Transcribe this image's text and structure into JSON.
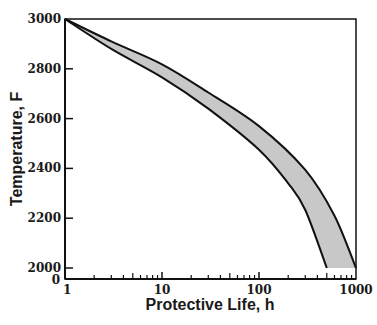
{
  "chart_data": {
    "type": "area",
    "title": "",
    "xlabel": "Protective Life, h",
    "ylabel": "Temperature, F",
    "x_scale": "log",
    "xlim": [
      1,
      1000
    ],
    "ylim": [
      2000,
      3000
    ],
    "y_axis_break_label": "0",
    "x_ticks": [
      1,
      10,
      100,
      1000
    ],
    "x_tick_labels": [
      "1",
      "10",
      "100",
      "1000"
    ],
    "y_ticks": [
      2000,
      2200,
      2400,
      2600,
      2800,
      3000
    ],
    "y_tick_labels": [
      "2000",
      "2200",
      "2400",
      "2600",
      "2800",
      "3000"
    ],
    "grid": false,
    "legend": null,
    "fill_color": "#c8c8c8",
    "series": [
      {
        "name": "upper bound",
        "x": [
          1,
          3,
          10,
          30,
          100,
          300,
          600,
          1000
        ],
        "y": [
          3000,
          2910,
          2818,
          2705,
          2570,
          2394,
          2210,
          2000
        ]
      },
      {
        "name": "lower bound",
        "x": [
          1,
          3,
          10,
          30,
          100,
          200,
          300,
          500
        ],
        "y": [
          3000,
          2880,
          2766,
          2640,
          2475,
          2340,
          2233,
          2000
        ]
      }
    ],
    "annotations": [
      "Shaded band between bounds"
    ]
  }
}
